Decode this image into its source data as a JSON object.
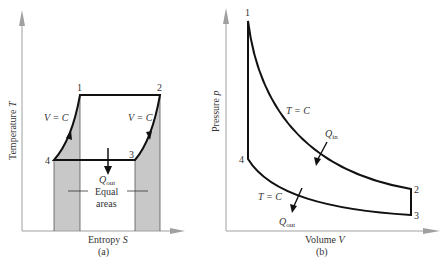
{
  "panel_a": {
    "caption": "(a)",
    "y_axis_label": "Temperature T",
    "y_axis_text": "Temperature ",
    "y_axis_var": "T",
    "x_axis_text": "Entropy ",
    "x_axis_var": "S",
    "points": {
      "p1": "1",
      "p2": "2",
      "p3": "3",
      "p4": "4"
    },
    "left_curve_label": "V = C",
    "right_curve_label": "V = C",
    "heat_label_main": "Q",
    "heat_label_sub": "out",
    "equal_line1": "Equal",
    "equal_line2": "areas"
  },
  "panel_b": {
    "caption": "(b)",
    "y_axis_text": "Pressure ",
    "y_axis_var": "p",
    "x_axis_text": "Volume ",
    "x_axis_var": "V",
    "points": {
      "p1": "1",
      "p2": "2",
      "p3": "3",
      "p4": "4"
    },
    "upper_curve_label": "T = C",
    "lower_curve_label": "T = C",
    "qin_main": "Q",
    "qin_sub": "in",
    "qout_main": "Q",
    "qout_sub": "out"
  },
  "colors": {
    "axis": "#a0a0a0",
    "curve": "#111111",
    "shade": "#c8c8c8",
    "text": "#333333"
  }
}
